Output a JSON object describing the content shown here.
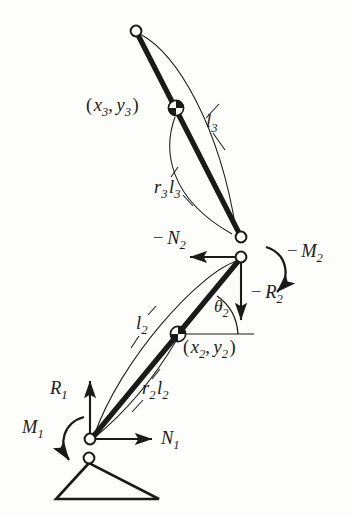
{
  "figure": {
    "background_color": "#fdfdfc",
    "ink_color": "#1a1a1a"
  },
  "labels": {
    "coord3": {
      "base": "( x",
      "sub1": "3",
      "mid": ", y",
      "sub2": "3",
      "close": " )",
      "text": "( x3, y3 )"
    },
    "l3": {
      "base": "l",
      "sub": "3",
      "text": "l3"
    },
    "r3l3": {
      "base": "r",
      "sub1": "3",
      "mid": "l",
      "sub2": "3",
      "text": "r3 l3"
    },
    "minus_N2": {
      "minus": "−",
      "base": "N",
      "sub": "2",
      "text": "− N2"
    },
    "minus_M2": {
      "minus": "−",
      "base": "M",
      "sub": "2",
      "text": "− M2"
    },
    "minus_R2": {
      "minus": "−",
      "base": "R",
      "sub": "2",
      "text": "− R2"
    },
    "theta2": {
      "base": "θ",
      "sub": "2",
      "text": "θ2"
    },
    "l2": {
      "base": "l",
      "sub": "2",
      "text": "l2"
    },
    "coord2": {
      "base": "( x",
      "sub1": "2",
      "mid": ", y",
      "sub2": "2",
      "close": " )",
      "text": "( x2, y2 )"
    },
    "r2l2": {
      "base": "r",
      "sub1": "2",
      "mid": "l",
      "sub2": "2",
      "text": "r2 l2"
    },
    "R1": {
      "base": "R",
      "sub": "1",
      "text": "R1"
    },
    "M1": {
      "base": "M",
      "sub": "1",
      "text": "M1"
    },
    "N1": {
      "base": "N",
      "sub": "1",
      "text": "N1"
    }
  },
  "nodes": {
    "tip3": {
      "name": "upper-link-tip-pivot",
      "x": 136,
      "y": 31,
      "r": 5.5
    },
    "com3": {
      "name": "link3-center-of-mass",
      "x": 176,
      "y": 108,
      "r": 7.5
    },
    "joint3": {
      "name": "link3-lower-pivot",
      "x": 241,
      "y": 237,
      "r": 5.5
    },
    "joint2": {
      "name": "link2-upper-pivot",
      "x": 241,
      "y": 257,
      "r": 5.5
    },
    "com2": {
      "name": "link2-center-of-mass",
      "x": 178,
      "y": 334,
      "r": 7.5
    },
    "basepivot": {
      "name": "link2-base-pivot",
      "x": 90,
      "y": 439,
      "r": 5.5
    },
    "ground": {
      "name": "ground-support-apex",
      "x": 89,
      "y": 458,
      "r": 5.5
    }
  },
  "ground_triangle": {
    "apex_x": 89,
    "apex_y": 462,
    "left_x": 56,
    "right_x": 159,
    "base_y": 499
  }
}
